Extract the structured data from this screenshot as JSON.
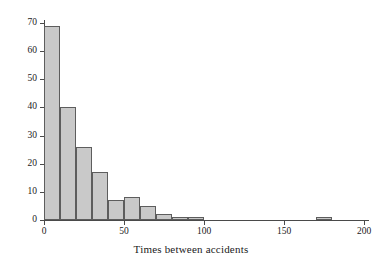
{
  "chart_data": {
    "type": "bar",
    "title": "",
    "subtitle": "",
    "xlabel": "Times between accidents",
    "ylabel": "",
    "xlim": [
      0,
      210
    ],
    "ylim": [
      0,
      72
    ],
    "grid": false,
    "legend": null,
    "bin_width": 10,
    "x_ticks": [
      0,
      50,
      100,
      150,
      200
    ],
    "x_tick_labels": [
      "0",
      "50",
      "100",
      "150",
      "200"
    ],
    "y_ticks": [
      0,
      10,
      20,
      30,
      40,
      50,
      60,
      70
    ],
    "y_tick_labels": [
      "0",
      "10",
      "20",
      "30",
      "40",
      "50",
      "60",
      "70"
    ],
    "bin_edges": [
      0,
      10,
      20,
      30,
      40,
      50,
      60,
      70,
      80,
      90,
      100,
      170,
      180
    ],
    "categories": [
      "0-10",
      "10-20",
      "20-30",
      "30-40",
      "40-50",
      "50-60",
      "60-70",
      "70-80",
      "80-90",
      "90-100",
      "170-180"
    ],
    "values": [
      69,
      40,
      26,
      17,
      7,
      8,
      5,
      2,
      1,
      1,
      1
    ],
    "bars": [
      {
        "x0": 0,
        "x1": 10,
        "value": 69
      },
      {
        "x0": 10,
        "x1": 20,
        "value": 40
      },
      {
        "x0": 20,
        "x1": 30,
        "value": 26
      },
      {
        "x0": 30,
        "x1": 40,
        "value": 17
      },
      {
        "x0": 40,
        "x1": 50,
        "value": 7
      },
      {
        "x0": 50,
        "x1": 60,
        "value": 8
      },
      {
        "x0": 60,
        "x1": 70,
        "value": 5
      },
      {
        "x0": 70,
        "x1": 80,
        "value": 2
      },
      {
        "x0": 80,
        "x1": 90,
        "value": 1
      },
      {
        "x0": 90,
        "x1": 100,
        "value": 1
      },
      {
        "x0": 170,
        "x1": 180,
        "value": 1
      }
    ],
    "colors": {
      "bar_fill": "#c9c9c9",
      "bar_edge": "#5d5d5d",
      "axis": "#4a4a4a",
      "text": "#1a1a1a",
      "background": "#ffffff"
    }
  }
}
